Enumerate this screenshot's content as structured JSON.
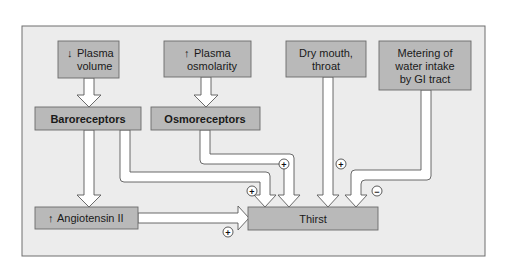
{
  "diagram": {
    "frame": {
      "fill": "#ececec",
      "stroke": "#6e6e6e"
    },
    "box_fill": "#b9b9b9",
    "box_stroke": "#6a6a6a",
    "arrow_fill": "#ffffff",
    "arrow_stroke": "#5a5a5a",
    "nodes": {
      "plasma_volume": {
        "arrow": "↓",
        "line1": "Plasma",
        "line2": "volume"
      },
      "plasma_osmolarity": {
        "arrow": "↑",
        "line1": "Plasma",
        "line2": "osmolarity"
      },
      "dry_mouth": {
        "line1": "Dry mouth,",
        "line2": "throat"
      },
      "metering": {
        "line1": "Metering of",
        "line2": "water intake",
        "line3": "by GI tract"
      },
      "baroreceptors": {
        "label": "Baroreceptors"
      },
      "osmoreceptors": {
        "label": "Osmoreceptors"
      },
      "angiotensin": {
        "arrow": "↑",
        "label": "Angiotensin II"
      },
      "thirst": {
        "label": "Thirst"
      }
    },
    "signs": {
      "baro_to_thirst": "+",
      "osmo_to_thirst": "+",
      "dry_to_thirst": "+",
      "metering_to_thirst": "−",
      "angio_to_thirst": "+"
    },
    "edges": [
      {
        "from": "Plasma volume",
        "to": "Baroreceptors"
      },
      {
        "from": "Plasma osmolarity",
        "to": "Osmoreceptors"
      },
      {
        "from": "Baroreceptors",
        "to": "Angiotensin II"
      },
      {
        "from": "Baroreceptors",
        "to": "Thirst",
        "sign": "+"
      },
      {
        "from": "Osmoreceptors",
        "to": "Thirst",
        "sign": "+"
      },
      {
        "from": "Dry mouth, throat",
        "to": "Thirst",
        "sign": "+"
      },
      {
        "from": "Metering of water intake by GI tract",
        "to": "Thirst",
        "sign": "−"
      },
      {
        "from": "Angiotensin II",
        "to": "Thirst",
        "sign": "+"
      }
    ]
  }
}
